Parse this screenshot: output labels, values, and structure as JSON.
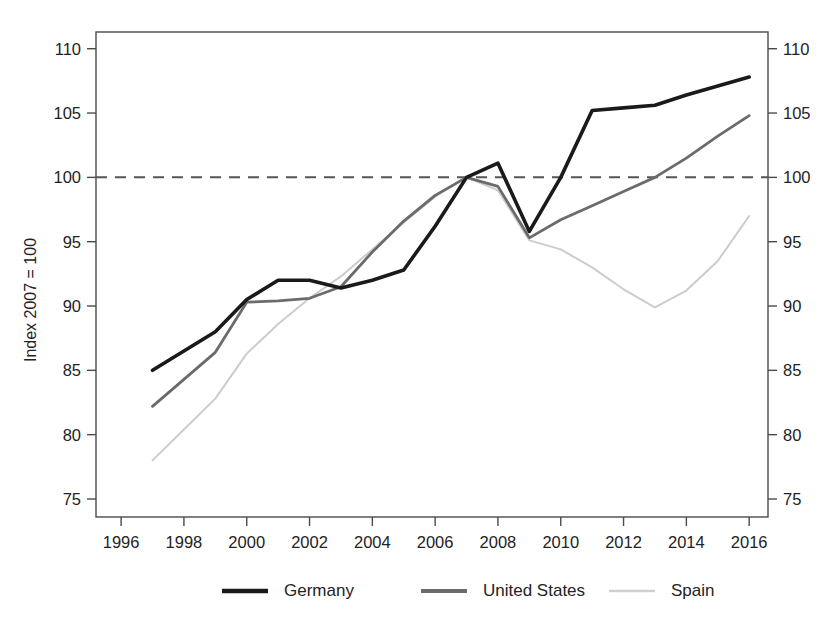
{
  "chart_data": {
    "type": "line",
    "title": "",
    "subtitle": "",
    "xlabel": "",
    "ylabel": "Index 2007 = 100",
    "xlim": [
      1995.2,
      2016.6
    ],
    "ylim": [
      73.6,
      111.3
    ],
    "grid": false,
    "legend_position": "bottom",
    "x_ticks": [
      1996,
      1998,
      2000,
      2002,
      2004,
      2006,
      2008,
      2010,
      2012,
      2014,
      2016
    ],
    "x_tick_labels": [
      "1996",
      "1998",
      "2000",
      "2002",
      "2004",
      "2006",
      "2008",
      "2010",
      "2012",
      "2014",
      "2016"
    ],
    "y_ticks": [
      75,
      80,
      85,
      90,
      95,
      100,
      105,
      110
    ],
    "y_tick_labels_left": [
      "75",
      "80",
      "85",
      "90",
      "95",
      "100",
      "105",
      "110"
    ],
    "y_tick_labels_right": [
      "75",
      "80",
      "85",
      "90",
      "95",
      "100",
      "105",
      "110"
    ],
    "reference_line": {
      "value": 100,
      "style": "dashed",
      "label": ""
    },
    "x": [
      1997,
      1998,
      1999,
      2000,
      2001,
      2002,
      2003,
      2004,
      2005,
      2006,
      2007,
      2008,
      2009,
      2010,
      2011,
      2012,
      2013,
      2014,
      2015,
      2016
    ],
    "series": [
      {
        "name": "Germany",
        "color": "#1a1a1a",
        "width": 3.6,
        "values": [
          85.0,
          86.5,
          88.0,
          90.5,
          92.0,
          92.0,
          91.4,
          92.0,
          92.8,
          96.2,
          100.0,
          101.1,
          95.8,
          100.0,
          105.2,
          105.4,
          105.6,
          106.4,
          107.1,
          107.8
        ]
      },
      {
        "name": "United States",
        "color": "#6b6b6b",
        "width": 2.8,
        "values": [
          82.2,
          84.3,
          86.4,
          90.3,
          90.4,
          90.6,
          91.5,
          94.2,
          96.6,
          98.6,
          100.0,
          99.3,
          95.3,
          96.7,
          97.8,
          98.9,
          100.0,
          101.5,
          103.2,
          104.8
        ]
      },
      {
        "name": "Spain",
        "color": "#cccccc",
        "width": 2.0,
        "values": [
          78.0,
          80.4,
          82.8,
          86.3,
          88.6,
          90.6,
          92.3,
          94.4,
          96.5,
          98.5,
          100.0,
          99.0,
          95.1,
          94.4,
          93.0,
          91.3,
          89.9,
          91.2,
          93.5,
          97.0
        ]
      }
    ],
    "legend": [
      {
        "label": "Germany",
        "color": "#1a1a1a",
        "width": 4.4
      },
      {
        "label": "United States",
        "color": "#6b6b6b",
        "width": 4.0
      },
      {
        "label": "Spain",
        "color": "#cfcfcf",
        "width": 2.6
      }
    ]
  }
}
